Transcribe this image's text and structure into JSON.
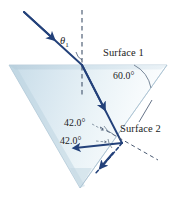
{
  "figure": {
    "kind": "optics-ray-diagram",
    "labels": {
      "surface_1": "Surface 1",
      "surface_2": "Surface 2",
      "apex_angle": "60.0°",
      "internal_angle": "42.0°",
      "reflected_angle": "42.0°",
      "incident_angle_symbol": "θ",
      "incident_angle_subscript": "1"
    },
    "colors": {
      "ray": "#23417a",
      "ray_dark": "#1d3566",
      "prism_fill_left": "#cfe0ea",
      "prism_fill_right": "#f4f9fb",
      "prism_edge": "#9fb9c9",
      "normal_dash": "#4a5a72",
      "text": "#1b1b1b",
      "background": "#ffffff"
    },
    "geometry": {
      "prism_vertices": "9,65 167,65 80,188",
      "entry_point": "82,65",
      "exit_point": "122,143",
      "normal_1": "82,10 to 82,96",
      "canvas": "177x197"
    }
  }
}
